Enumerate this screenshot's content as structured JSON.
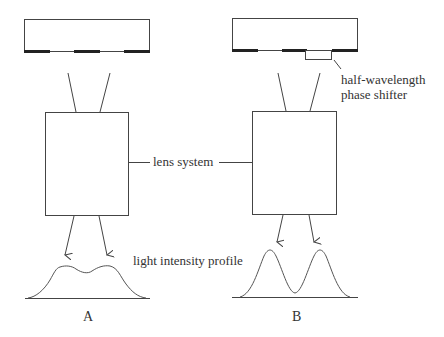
{
  "diagram": {
    "labels": {
      "phase_shifter_line1": "half-wavelength",
      "phase_shifter_line2": "phase shifter",
      "lens_system": "lens system",
      "intensity_profile": "light intensity profile",
      "panel_a": "A",
      "panel_b": "B"
    },
    "panels": [
      {
        "id": "A",
        "mask": "binary mask (opaque chrome segments)",
        "profile": "broad, poorly resolved double bump"
      },
      {
        "id": "B",
        "mask": "mask with half-wavelength phase shifter",
        "profile": "two sharply resolved peaks"
      }
    ],
    "colors": {
      "stroke": "#444444",
      "chrome": "#222222",
      "text": "#333333",
      "background": "#ffffff"
    }
  }
}
